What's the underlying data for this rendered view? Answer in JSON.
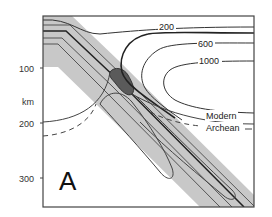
{
  "figure": {
    "panel_label": "A",
    "y_axis": {
      "unit_label": "km",
      "ticks": [
        "100",
        "200",
        "300"
      ]
    },
    "isotherm_labels": [
      "200",
      "600",
      "1000"
    ],
    "curve_labels": {
      "modern": "Modern",
      "archean": "Archean"
    },
    "colors": {
      "slab_fill": "#c8c8c8",
      "melt_zone_fill": "#5a5a5a",
      "line": "#333333",
      "frame": "#444444"
    }
  }
}
